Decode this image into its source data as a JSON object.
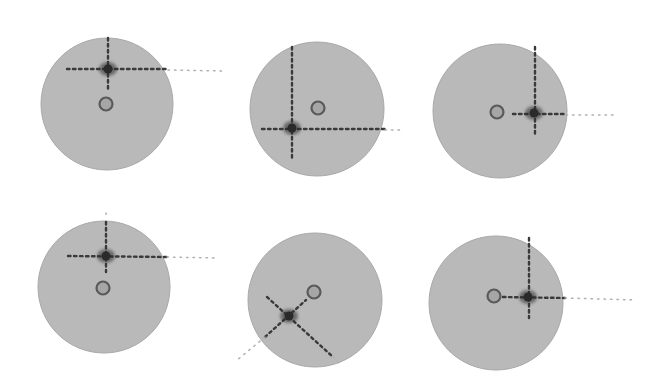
{
  "canvas": {
    "width": 652,
    "height": 388,
    "background": "#ffffff"
  },
  "colors": {
    "disc_fill": "#b9b9b9",
    "disc_edge": "#a8a8a8",
    "dotted_line": "#3a3a3a",
    "dotted_line_faint": "#b0b0b0",
    "marker": "#2a2a2a",
    "ring_stroke": "#5a5a5a",
    "ring_fill": "#a6a6a6"
  },
  "panels": [
    {
      "id": "p1",
      "disc": {
        "cx": 107,
        "cy": 104,
        "r": 66
      },
      "ring": {
        "cx": 106,
        "cy": 104
      },
      "marker": {
        "x": 108,
        "y": 69
      },
      "lines": [
        {
          "x1": 108,
          "y1": 38,
          "x2": 108,
          "y2": 92,
          "faint": false
        },
        {
          "x1": 67,
          "y1": 69,
          "x2": 168,
          "y2": 69,
          "faint": false
        },
        {
          "x1": 168,
          "y1": 70,
          "x2": 222,
          "y2": 71,
          "faint": true
        }
      ]
    },
    {
      "id": "p2",
      "disc": {
        "cx": 317,
        "cy": 109,
        "r": 67
      },
      "ring": {
        "cx": 318,
        "cy": 108
      },
      "marker": {
        "x": 292,
        "y": 128
      },
      "lines": [
        {
          "x1": 292,
          "y1": 47,
          "x2": 292,
          "y2": 160,
          "faint": false
        },
        {
          "x1": 262,
          "y1": 129,
          "x2": 385,
          "y2": 129,
          "faint": false
        },
        {
          "x1": 385,
          "y1": 130,
          "x2": 400,
          "y2": 130,
          "faint": true
        }
      ]
    },
    {
      "id": "p3",
      "disc": {
        "cx": 500,
        "cy": 111,
        "r": 67
      },
      "ring": {
        "cx": 497,
        "cy": 112
      },
      "marker": {
        "x": 534,
        "y": 113
      },
      "lines": [
        {
          "x1": 535,
          "y1": 47,
          "x2": 535,
          "y2": 135,
          "faint": false
        },
        {
          "x1": 513,
          "y1": 114,
          "x2": 566,
          "y2": 114,
          "faint": false
        },
        {
          "x1": 566,
          "y1": 115,
          "x2": 615,
          "y2": 115,
          "faint": true
        }
      ]
    },
    {
      "id": "p4",
      "disc": {
        "cx": 104,
        "cy": 287,
        "r": 66
      },
      "ring": {
        "cx": 103,
        "cy": 288
      },
      "marker": {
        "x": 106,
        "y": 256
      },
      "lines": [
        {
          "x1": 106,
          "y1": 213,
          "x2": 106,
          "y2": 218,
          "faint": true
        },
        {
          "x1": 106,
          "y1": 222,
          "x2": 106,
          "y2": 272,
          "faint": false
        },
        {
          "x1": 68,
          "y1": 256,
          "x2": 167,
          "y2": 257,
          "faint": false
        },
        {
          "x1": 167,
          "y1": 257,
          "x2": 218,
          "y2": 258,
          "faint": true
        }
      ]
    },
    {
      "id": "p5",
      "disc": {
        "cx": 315,
        "cy": 300,
        "r": 67
      },
      "ring": {
        "cx": 314,
        "cy": 292
      },
      "marker": {
        "x": 289,
        "y": 316
      },
      "lines": [
        {
          "x1": 267,
          "y1": 297,
          "x2": 333,
          "y2": 357,
          "faint": false
        },
        {
          "x1": 265,
          "y1": 337,
          "x2": 306,
          "y2": 300,
          "faint": false
        },
        {
          "x1": 265,
          "y1": 337,
          "x2": 236,
          "y2": 361,
          "faint": true
        },
        {
          "x1": 333,
          "y1": 357,
          "x2": 340,
          "y2": 364,
          "faint": true
        }
      ]
    },
    {
      "id": "p6",
      "disc": {
        "cx": 496,
        "cy": 303,
        "r": 67
      },
      "ring": {
        "cx": 494,
        "cy": 296
      },
      "marker": {
        "x": 528,
        "y": 297
      },
      "lines": [
        {
          "x1": 529,
          "y1": 238,
          "x2": 529,
          "y2": 318,
          "faint": false
        },
        {
          "x1": 503,
          "y1": 297,
          "x2": 565,
          "y2": 298,
          "faint": false
        },
        {
          "x1": 565,
          "y1": 298,
          "x2": 636,
          "y2": 300,
          "faint": true
        }
      ]
    }
  ]
}
